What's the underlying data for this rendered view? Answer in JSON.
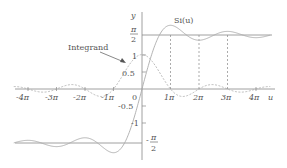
{
  "chart_data": {
    "type": "line",
    "title": "",
    "xlabel": "u",
    "ylabel": "y",
    "x_ticks": [
      "-4π",
      "-3π",
      "-2π",
      "-1π",
      "0",
      "1π",
      "2π",
      "3π",
      "4π"
    ],
    "y_ticks": [
      "π/2",
      "1",
      "0.5",
      "-0.5",
      "-1",
      "-π/2"
    ],
    "series": [
      {
        "name": "Si(u)",
        "style": "solid",
        "description": "Sine integral, asymptotes to ±π/2"
      },
      {
        "name": "Integrand",
        "style": "dashed",
        "description": "sin(u)/u, peak 1 at u=0"
      }
    ],
    "annotations": [
      "Si(u)",
      "Integrand"
    ],
    "reference_lines": [
      "y=π/2",
      "y=-π/2",
      "dashed verticals at u=π,2π,3π"
    ],
    "xlim": [
      "-4.5π",
      "4.5π"
    ],
    "ylim": [
      -1.9,
      1.9
    ]
  },
  "labels": {
    "y_axis": "y",
    "u_axis": "u",
    "si": "Si(u)",
    "integrand": "Integrand",
    "pi": "π",
    "two": "2",
    "one": "1",
    "half": "0.5",
    "neg_half": "-0.5",
    "neg_one": "-1",
    "zero": "0",
    "minus": "-",
    "xt_m4": "-4π",
    "xt_m3": "-3π",
    "xt_m2": "-2π",
    "xt_m1": "-1π",
    "xt_1": "1π",
    "xt_2": "2π",
    "xt_3": "3π",
    "xt_4": "4π"
  }
}
